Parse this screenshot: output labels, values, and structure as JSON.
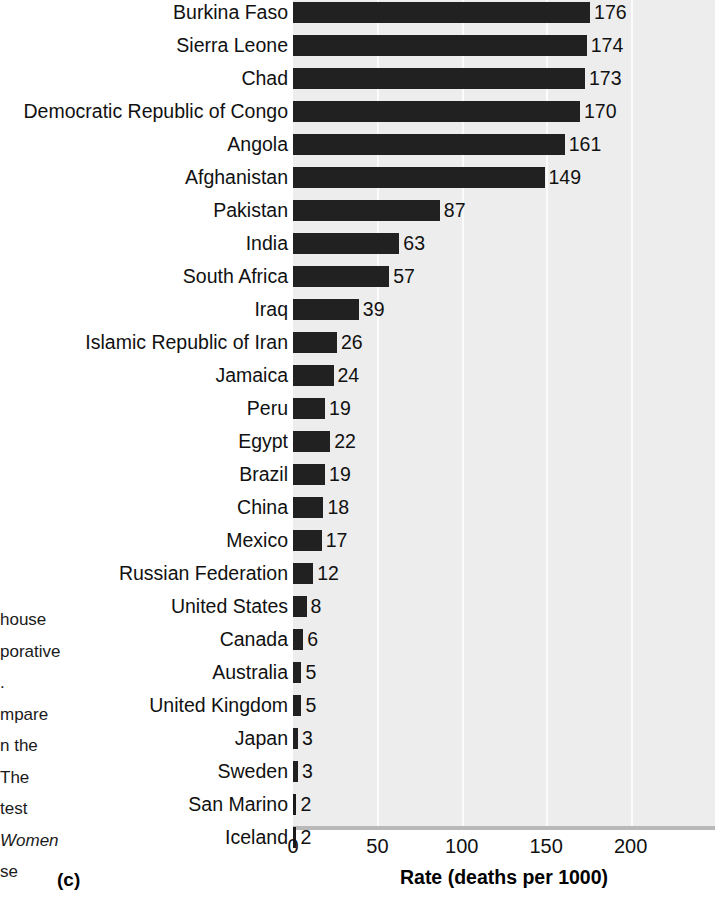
{
  "chart_data": {
    "type": "bar",
    "orientation": "horizontal",
    "title": "",
    "xlabel": "Rate (deaths per 1000)",
    "ylabel": "",
    "xlim": [
      0,
      250
    ],
    "xticks": [
      0,
      50,
      100,
      150,
      200
    ],
    "grid": true,
    "legend": null,
    "bar_value_labels": true,
    "categories": [
      "Burkina Faso",
      "Sierra Leone",
      "Chad",
      "Democratic Republic of Congo",
      "Angola",
      "Afghanistan",
      "Pakistan",
      "India",
      "South Africa",
      "Iraq",
      "Islamic Republic of Iran",
      "Jamaica",
      "Peru",
      "Egypt",
      "Brazil",
      "China",
      "Mexico",
      "Russian Federation",
      "United States",
      "Canada",
      "Australia",
      "United Kingdom",
      "Japan",
      "Sweden",
      "San Marino",
      "Iceland"
    ],
    "values": [
      176,
      174,
      173,
      170,
      161,
      149,
      87,
      63,
      57,
      39,
      26,
      24,
      19,
      22,
      19,
      18,
      17,
      12,
      8,
      6,
      5,
      5,
      3,
      3,
      2,
      2
    ]
  },
  "figure": {
    "panel_letter": "(c)"
  },
  "margin_text": {
    "lines": [
      {
        "text": "house",
        "italic": false
      },
      {
        "text": "porative",
        "italic": false
      },
      {
        "text": ".",
        "italic": false
      },
      {
        "text": "mpare",
        "italic": false
      },
      {
        "text": "n the",
        "italic": false
      },
      {
        "text": "The",
        "italic": false
      },
      {
        "text": "test",
        "italic": false
      },
      {
        "text": "Women",
        "italic": true
      },
      {
        "text": "se",
        "italic": false
      }
    ]
  },
  "colors": {
    "bar": "#212121",
    "plot_background": "#ededed",
    "gridline": "#fbfbfb",
    "axis_line": "#b9b9b9",
    "text": "#111111",
    "page_background": "#ffffff"
  }
}
